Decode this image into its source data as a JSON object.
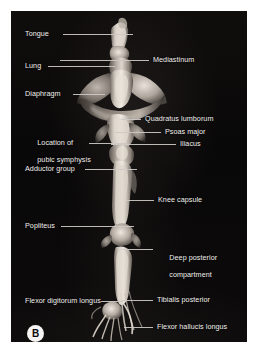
{
  "figure": {
    "panel_badge": "B",
    "background_color": "#0a0909",
    "plate_border_color": "#ffffff",
    "label_color": "#f2f0ee",
    "leader_color": "#cdc9c4"
  },
  "labels_left": [
    {
      "name": "tongue",
      "text": "Tongue",
      "lines": [
        "Tongue"
      ]
    },
    {
      "name": "lung",
      "text": "Lung",
      "lines": [
        "Lung"
      ]
    },
    {
      "name": "diaphragm",
      "text": "Diaphragm",
      "lines": [
        "Diaphragm"
      ]
    },
    {
      "name": "pubic-symphysis",
      "text": "Location of pubic symphysis",
      "lines": [
        "Location of",
        "pubic symphysis"
      ]
    },
    {
      "name": "adductor-group",
      "text": "Adductor group",
      "lines": [
        "Adductor group"
      ]
    },
    {
      "name": "popliteus",
      "text": "Popliteus",
      "lines": [
        "Popliteus"
      ]
    },
    {
      "name": "flexor-digitorum-longus",
      "text": "Flexor digitorum longus",
      "lines": [
        "Flexor digitorum longus"
      ]
    }
  ],
  "labels_right": [
    {
      "name": "mediastinum",
      "text": "Mediastinum",
      "lines": [
        "Mediastinum"
      ]
    },
    {
      "name": "quadratus-lumborum",
      "text": "Quadratus lumborum",
      "lines": [
        "Quadratus lumborum"
      ]
    },
    {
      "name": "psoas-major",
      "text": "Psoas major",
      "lines": [
        "Psoas major"
      ]
    },
    {
      "name": "iliacus",
      "text": "Iliacus",
      "lines": [
        "Iliacus"
      ]
    },
    {
      "name": "knee-capsule",
      "text": "Knee capsule",
      "lines": [
        "Knee capsule"
      ]
    },
    {
      "name": "deep-posterior-compartment",
      "text": "Deep posterior compartment",
      "lines": [
        "Deep posterior",
        "compartment"
      ]
    },
    {
      "name": "tibialis-posterior",
      "text": "Tibialis posterior",
      "lines": [
        "Tibialis posterior"
      ]
    },
    {
      "name": "flexor-hallucis-longus",
      "text": "Flexor hallucis longus",
      "lines": [
        "Flexor hallucis longus"
      ]
    }
  ],
  "text": {
    "tongue": "Tongue",
    "lung": "Lung",
    "diaphragm": "Diaphragm",
    "pubic_symphysis_l1": "Location of",
    "pubic_symphysis_l2": "pubic symphysis",
    "adductor_group": "Adductor group",
    "popliteus": "Popliteus",
    "flexor_digitorum_longus": "Flexor digitorum longus",
    "mediastinum": "Mediastinum",
    "quadratus_lumborum": "Quadratus lumborum",
    "psoas_major": "Psoas major",
    "iliacus": "Iliacus",
    "knee_capsule": "Knee capsule",
    "deep_posterior_l1": "Deep posterior",
    "deep_posterior_l2": "compartment",
    "tibialis_posterior": "Tibialis posterior",
    "flexor_hallucis_longus": "Flexor hallucis longus",
    "panel_badge": "B"
  }
}
